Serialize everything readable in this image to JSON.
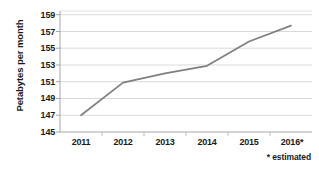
{
  "chart_data": {
    "type": "line",
    "title": "",
    "subtitle": "",
    "xlabel": "",
    "ylabel": "Petabytes per month",
    "categories": [
      "2011",
      "2012",
      "2013",
      "2014",
      "2015",
      "2016*"
    ],
    "x": [
      2011,
      2012,
      2013,
      2014,
      2015,
      2016
    ],
    "values": [
      147,
      150.9,
      152,
      152.9,
      155.8,
      157.7
    ],
    "series": [
      {
        "name": "Petabytes per month",
        "values": [
          147,
          150.9,
          152,
          152.9,
          155.8,
          157.7
        ]
      }
    ],
    "ylim": [
      145,
      159
    ],
    "ytick_labels": [
      "145",
      "147",
      "149",
      "151",
      "153",
      "155",
      "157",
      "159"
    ],
    "ytick_values": [
      145,
      147,
      149,
      151,
      153,
      155,
      157,
      159
    ],
    "grid": true,
    "grid_axis": "y",
    "legend": false,
    "legend_position": "none",
    "annotations": [
      "* estimated"
    ],
    "line_color": "#7f7f7f",
    "grid_color": "#d9d9d9",
    "axis_color": "#a6a6a6",
    "text_color": "#1a1a1a",
    "background": "#ffffff"
  },
  "footnote": {
    "text": "* estimated"
  }
}
